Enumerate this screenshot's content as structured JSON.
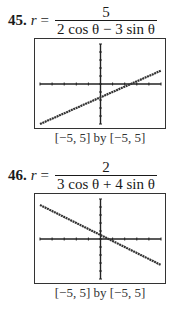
{
  "problems": [
    {
      "number": "45.",
      "lhs": "r",
      "equals": "=",
      "numerator": "5",
      "denominator": "2 cos θ − 3 sin θ",
      "window_caption": "[−5, 5] by [−5, 5]"
    },
    {
      "number": "46.",
      "lhs": "r",
      "equals": "=",
      "numerator": "2",
      "denominator": "3 cos θ + 4 sin θ",
      "window_caption": "[−5, 5] by [−5, 5]"
    }
  ],
  "chart_data": [
    {
      "type": "line",
      "title": "r = 5/(2 cos θ − 3 sin θ)",
      "cartesian_equivalent": "2x − 3y = 5",
      "x": [
        -5,
        5
      ],
      "y": [
        -5,
        1.67
      ],
      "xlim": [
        -5,
        5
      ],
      "ylim": [
        -5,
        5
      ],
      "xticks": [
        -5,
        -4,
        -3,
        -2,
        -1,
        0,
        1,
        2,
        3,
        4,
        5
      ],
      "yticks": [
        -5,
        -4,
        -3,
        -2,
        -1,
        0,
        1,
        2,
        3,
        4,
        5
      ],
      "grid": false,
      "xlabel": "",
      "ylabel": "",
      "caption": "[−5, 5] by [−5, 5]"
    },
    {
      "type": "line",
      "title": "r = 2/(3 cos θ + 4 sin θ)",
      "cartesian_equivalent": "3x + 4y = 2",
      "x": [
        -5,
        5
      ],
      "y": [
        4.25,
        -3.25
      ],
      "xlim": [
        -5,
        5
      ],
      "ylim": [
        -5,
        5
      ],
      "xticks": [
        -5,
        -4,
        -3,
        -2,
        -1,
        0,
        1,
        2,
        3,
        4,
        5
      ],
      "yticks": [
        -5,
        -4,
        -3,
        -2,
        -1,
        0,
        1,
        2,
        3,
        4,
        5
      ],
      "grid": false,
      "xlabel": "",
      "ylabel": "",
      "caption": "[−5, 5] by [−5, 5]"
    }
  ]
}
